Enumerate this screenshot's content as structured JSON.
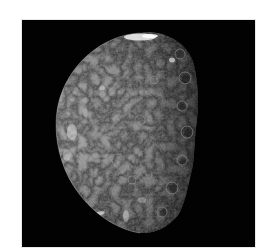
{
  "page": {
    "cropped_header_text": ""
  },
  "photo": {
    "subject": "moon-photograph",
    "description": "Grayscale spacecraft photograph of a cratered moon, illuminated from the left, with the terminator on the right and a bright cap near the top limb",
    "background_color": "#020202",
    "limb_color": "#9a9a9a",
    "surface_mid_color": "#6e6e6e",
    "shadow_color": "#1a1a1a",
    "highlight_color": "#e6e6e6"
  }
}
